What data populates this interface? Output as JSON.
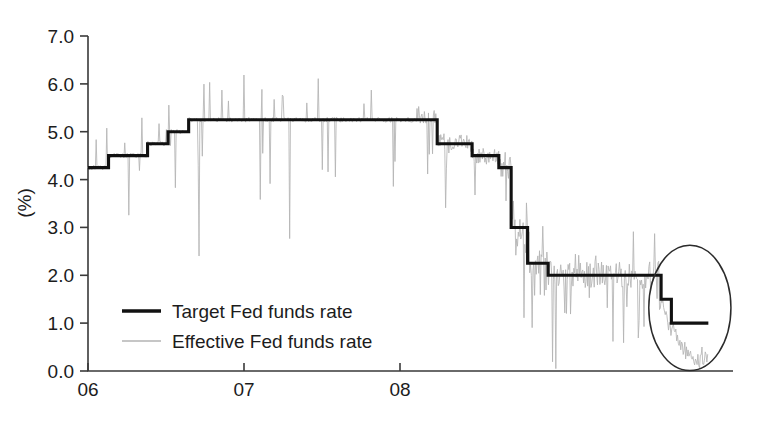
{
  "chart_data": {
    "type": "line",
    "title": "",
    "subtitle": "",
    "xlabel": "",
    "ylabel": "(%)",
    "xlim": [
      2006.0,
      2009.14
    ],
    "ylim": [
      0.0,
      7.0
    ],
    "grid": false,
    "legend_position": "inside-lower-left",
    "y_ticks": [
      "0.0",
      "1.0",
      "2.0",
      "3.0",
      "4.0",
      "5.0",
      "6.0",
      "7.0"
    ],
    "y_tick_values": [
      0.0,
      1.0,
      2.0,
      3.0,
      4.0,
      5.0,
      6.0,
      7.0
    ],
    "x_ticks": [
      "06",
      "07",
      "08"
    ],
    "x_tick_values": [
      2006.0,
      2007.0,
      2008.0
    ],
    "colors": {
      "target": "#111111",
      "effective": "#b3b3b3",
      "axis": "#3a3a3a",
      "annotation": "#2b2b2b",
      "background": "#ffffff"
    },
    "series": [
      {
        "name": "Target Fed funds rate",
        "style": "step",
        "color": "#111111",
        "steps": [
          {
            "x_start": 2006.0,
            "x_end": 2006.1,
            "value": 4.25
          },
          {
            "x_start": 2006.1,
            "x_end": 2006.29,
            "value": 4.5
          },
          {
            "x_start": 2006.29,
            "x_end": 2006.39,
            "value": 4.75
          },
          {
            "x_start": 2006.39,
            "x_end": 2006.49,
            "value": 5.0
          },
          {
            "x_start": 2006.49,
            "x_end": 2007.7,
            "value": 5.25
          },
          {
            "x_start": 2007.7,
            "x_end": 2007.87,
            "value": 4.75
          },
          {
            "x_start": 2007.87,
            "x_end": 2008.0,
            "value": 4.5
          },
          {
            "x_start": 2008.0,
            "x_end": 2008.06,
            "value": 4.25
          },
          {
            "x_start": 2008.06,
            "x_end": 2008.14,
            "value": 3.0
          },
          {
            "x_start": 2008.14,
            "x_end": 2008.24,
            "value": 2.25
          },
          {
            "x_start": 2008.24,
            "x_end": 2008.79,
            "value": 2.0
          },
          {
            "x_start": 2008.79,
            "x_end": 2008.84,
            "value": 1.5
          },
          {
            "x_start": 2008.84,
            "x_end": 2009.02,
            "value": 1.0
          }
        ]
      },
      {
        "name": "Effective Fed funds rate",
        "style": "line-noisy",
        "color": "#b3b3b3",
        "description": "Daily effective rate oscillating around the target with frequent upward spikes and downward dips; collapses toward near zero at the end of the sample.",
        "notable_values": [
          {
            "x": 2006.02,
            "y": 4.3
          },
          {
            "x": 2006.05,
            "y": 4.9
          },
          {
            "x": 2006.5,
            "y": 5.25
          },
          {
            "x": 2006.75,
            "y": 6.0
          },
          {
            "x": 2007.2,
            "y": 5.9
          },
          {
            "x": 2007.55,
            "y": 5.95
          },
          {
            "x": 2007.72,
            "y": 4.7
          },
          {
            "x": 2008.08,
            "y": 2.9
          },
          {
            "x": 2008.25,
            "y": 2.0
          },
          {
            "x": 2008.7,
            "y": 2.05
          },
          {
            "x": 2008.82,
            "y": 1.1
          },
          {
            "x": 2008.92,
            "y": 0.3
          },
          {
            "x": 2009.0,
            "y": 0.25
          }
        ]
      }
    ],
    "annotations": [
      {
        "type": "ellipse",
        "name": "final-rate-cuts-highlight",
        "cx": 2008.93,
        "cy": 1.32,
        "rx": 0.2,
        "ry": 1.31
      }
    ]
  },
  "legend": {
    "entries": [
      {
        "label": "Target Fed funds rate",
        "swatch": "thick-black-line"
      },
      {
        "label": "Effective Fed funds rate",
        "swatch": "thin-gray-line"
      }
    ]
  },
  "axes": {
    "y_title": "(%)",
    "y_labels": [
      "7.0",
      "6.0",
      "5.0",
      "4.0",
      "3.0",
      "2.0",
      "1.0",
      "0.0"
    ],
    "x_labels": [
      "06",
      "07",
      "08"
    ]
  }
}
